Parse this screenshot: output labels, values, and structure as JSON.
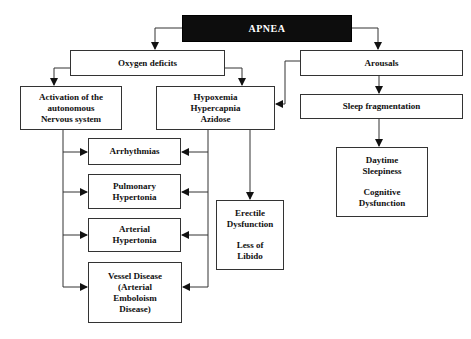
{
  "diagram": {
    "root": "APNEA",
    "nodes": {
      "oxygen_deficits": "Oxygen deficits",
      "arousals": "Arousals",
      "activation": [
        "Activation of the",
        "autonomous",
        "Nervous system"
      ],
      "hypoxemia": [
        "Hypoxemia",
        "Hypercapnia",
        "Azidose"
      ],
      "sleep_fragmentation": "Sleep fragmentation",
      "arrhythmias": "Arrhythmias",
      "pulmonary": [
        "Pulmonary",
        "Hypertonia"
      ],
      "arterial": [
        "Arterial",
        "Hypertonia"
      ],
      "vessel": [
        "Vessel Disease",
        "(Arterial",
        "Emboloism",
        "Disease)"
      ],
      "erectile": [
        "Erectile",
        "Dysfunction",
        "",
        "Less of",
        "Libido"
      ],
      "daytime": [
        "Daytime",
        "Sleepiness",
        "",
        "Cognitive",
        "Dysfunction"
      ]
    },
    "edges": [
      [
        "APNEA",
        "Oxygen deficits"
      ],
      [
        "APNEA",
        "Arousals"
      ],
      [
        "Oxygen deficits",
        "Activation of the autonomous Nervous system"
      ],
      [
        "Oxygen deficits",
        "Hypoxemia Hypercapnia Azidose"
      ],
      [
        "Arousals",
        "Hypoxemia Hypercapnia Azidose"
      ],
      [
        "Arousals",
        "Sleep fragmentation"
      ],
      [
        "Sleep fragmentation",
        "Daytime Sleepiness / Cognitive Dysfunction"
      ],
      [
        "Activation of the autonomous Nervous system",
        "Arrhythmias"
      ],
      [
        "Activation of the autonomous Nervous system",
        "Pulmonary Hypertonia"
      ],
      [
        "Activation of the autonomous Nervous system",
        "Arterial Hypertonia"
      ],
      [
        "Activation of the autonomous Nervous system",
        "Vessel Disease (Arterial Emboloism Disease)"
      ],
      [
        "Hypoxemia Hypercapnia Azidose",
        "Arrhythmias"
      ],
      [
        "Hypoxemia Hypercapnia Azidose",
        "Pulmonary Hypertonia"
      ],
      [
        "Hypoxemia Hypercapnia Azidose",
        "Arterial Hypertonia"
      ],
      [
        "Hypoxemia Hypercapnia Azidose",
        "Vessel Disease (Arterial Emboloism Disease)"
      ],
      [
        "Hypoxemia Hypercapnia Azidose",
        "Erectile Dysfunction / Less of Libido"
      ]
    ],
    "colors": {
      "root_bg": "#0d0d0d",
      "root_text": "#ffffff",
      "line": "#333333",
      "box_border": "#333333"
    }
  }
}
